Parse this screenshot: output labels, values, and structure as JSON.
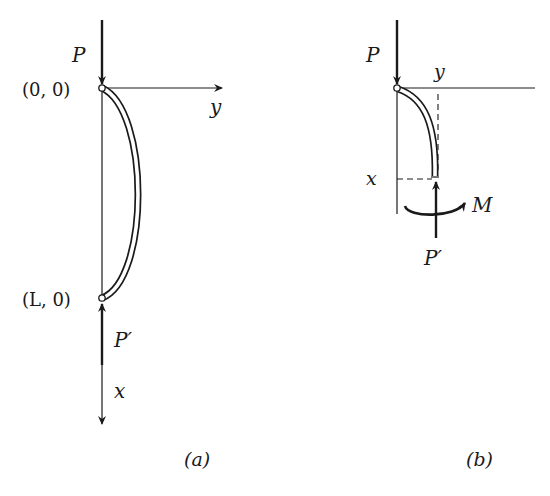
{
  "figure_a": {
    "caption": "(a)",
    "labels": {
      "force_top": "P",
      "origin": "(0, 0)",
      "end_point": "(L, 0)",
      "force_bottom": "P′",
      "axis_y": "y",
      "axis_x": "x"
    }
  },
  "figure_b": {
    "caption": "(b)",
    "labels": {
      "force_top": "P",
      "axis_y": "y",
      "axis_x": "x",
      "force_bottom": "P′",
      "moment": "M"
    }
  },
  "colors": {
    "ink": "#1a1a1a",
    "background": "#ffffff"
  }
}
